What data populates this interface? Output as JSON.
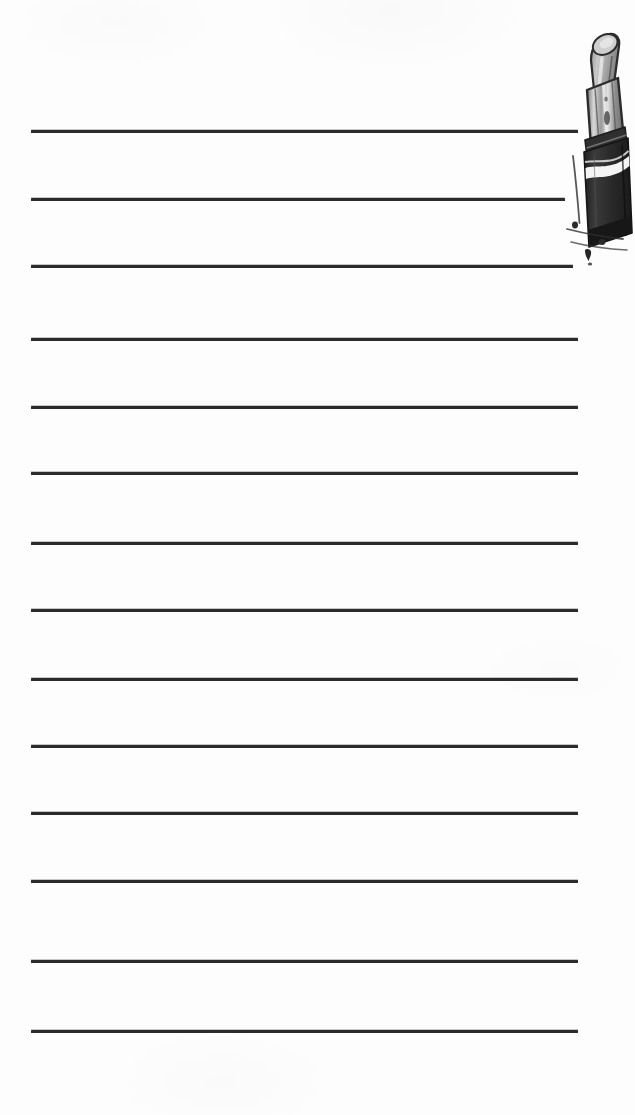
{
  "page": {
    "width": 635,
    "height": 1115,
    "background_color": "#fdfdfd",
    "rule_color": "#2b2b2b",
    "rule_thickness_px": 3,
    "rule_count": 14,
    "rule_left_x": 31,
    "rule_right_x": 578,
    "rule_spacing_px": 68
  },
  "rules": [
    {
      "index": 1,
      "y": 130,
      "x_start": 31,
      "x_end": 578
    },
    {
      "index": 2,
      "y": 198,
      "x_start": 31,
      "x_end": 565
    },
    {
      "index": 3,
      "y": 265,
      "x_start": 31,
      "x_end": 573
    },
    {
      "index": 4,
      "y": 338,
      "x_start": 31,
      "x_end": 578
    },
    {
      "index": 5,
      "y": 406,
      "x_start": 31,
      "x_end": 578
    },
    {
      "index": 6,
      "y": 472,
      "x_start": 31,
      "x_end": 578
    },
    {
      "index": 7,
      "y": 542,
      "x_start": 31,
      "x_end": 578
    },
    {
      "index": 8,
      "y": 609,
      "x_start": 31,
      "x_end": 578
    },
    {
      "index": 9,
      "y": 678,
      "x_start": 31,
      "x_end": 578
    },
    {
      "index": 10,
      "y": 745,
      "x_start": 31,
      "x_end": 578
    },
    {
      "index": 11,
      "y": 812,
      "x_start": 31,
      "x_end": 578
    },
    {
      "index": 12,
      "y": 880,
      "x_start": 31,
      "x_end": 578
    },
    {
      "index": 13,
      "y": 960,
      "x_start": 31,
      "x_end": 578
    },
    {
      "index": 14,
      "y": 1030,
      "x_start": 31,
      "x_end": 578
    }
  ],
  "illustration": {
    "name": "lipstick",
    "style": "engraved ink drawing",
    "position": {
      "x": 545,
      "y": 18,
      "width": 90,
      "height": 250
    },
    "parts": [
      {
        "name": "bullet-tip",
        "description": "angled lipstick bullet, light grey",
        "color": "#b9b9b9"
      },
      {
        "name": "case-upper",
        "description": "striated metal sleeve",
        "color": "#cfcfcf"
      },
      {
        "name": "case-collar",
        "description": "dark rim band",
        "color": "#3a3a3a"
      },
      {
        "name": "case-barrel",
        "description": "dark lower barrel",
        "color": "#333333"
      },
      {
        "name": "highlight",
        "description": "white diagonal highlight band",
        "color": "#ffffff"
      },
      {
        "name": "drip",
        "description": "small ink drip below the case",
        "color": "#2e2e2e"
      }
    ]
  }
}
